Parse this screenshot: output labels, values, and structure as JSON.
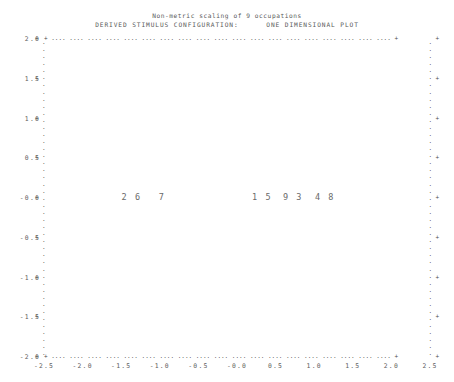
{
  "plot": {
    "title_line1": "Non-metric scaling of 9 occupations",
    "title_line2": "DERIVED STIMULUS CONFIGURATION:      ONE DIMENSIONAL PLOT",
    "frame_dot": ".",
    "tick_mark": "+",
    "edge_dot": "+"
  },
  "chart_data": {
    "type": "scatter",
    "title": "Non-metric scaling of 9 occupations",
    "subtitle": "DERIVED STIMULUS CONFIGURATION:      ONE DIMENSIONAL PLOT",
    "xlabel": "",
    "ylabel": "",
    "xlim": [
      -2.5,
      2.5
    ],
    "ylim": [
      -2.0,
      2.0
    ],
    "grid": false,
    "legend": "none",
    "xticks": [
      "-2.5",
      "-2.0",
      "-1.5",
      "-1.0",
      "-0.5",
      "-0.0",
      "0.5",
      "1.0",
      "1.5",
      "2.0",
      "2.5"
    ],
    "xtick_values": [
      -2.5,
      -2.0,
      -1.5,
      -1.0,
      -0.5,
      0.0,
      0.5,
      1.0,
      1.5,
      2.0,
      2.5
    ],
    "yticks": [
      "2.0",
      "1.5",
      "1.0",
      "0.5",
      "-0.0",
      "-0.5",
      "-1.0",
      "-1.5",
      "-2.0"
    ],
    "ytick_values": [
      2.0,
      1.5,
      1.0,
      0.5,
      0.0,
      -0.5,
      -1.0,
      -1.5,
      -2.0
    ],
    "points": [
      {
        "label": "2",
        "x": -1.43,
        "y": 0.0
      },
      {
        "label": "6",
        "x": -1.3,
        "y": 0.0
      },
      {
        "label": "7",
        "x": -0.97,
        "y": 0.0
      },
      {
        "label": "1",
        "x": 0.26,
        "y": 0.0
      },
      {
        "label": "5",
        "x": 0.39,
        "y": 0.0
      },
      {
        "label": "9",
        "x": 0.66,
        "y": 0.0
      },
      {
        "label": "3",
        "x": 0.79,
        "y": 0.0
      },
      {
        "label": "4",
        "x": 1.07,
        "y": 0.0
      },
      {
        "label": "8",
        "x": 1.21,
        "y": 0.0
      }
    ],
    "point_groups": [
      {
        "text": "2 6",
        "x": -1.365,
        "y": 0.0
      },
      {
        "text": "7",
        "x": -0.97,
        "y": 0.0
      },
      {
        "text": "1 5",
        "x": 0.325,
        "y": 0.0
      },
      {
        "text": "9 3",
        "x": 0.725,
        "y": 0.0
      },
      {
        "text": "4 8",
        "x": 1.14,
        "y": 0.0
      }
    ]
  }
}
